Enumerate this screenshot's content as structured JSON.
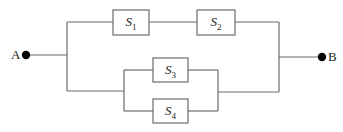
{
  "diagram": {
    "type": "reliability-block-diagram",
    "terminals": [
      {
        "id": "A",
        "label": "A"
      },
      {
        "id": "B",
        "label": "B"
      }
    ],
    "components": [
      {
        "id": "S1",
        "symbol": "S",
        "subscript": "1"
      },
      {
        "id": "S2",
        "symbol": "S",
        "subscript": "2"
      },
      {
        "id": "S3",
        "symbol": "S",
        "subscript": "3"
      },
      {
        "id": "S4",
        "symbol": "S",
        "subscript": "4"
      }
    ],
    "structure": "A — [ (S1 series S2) parallel (S3 parallel S4) ] — B",
    "colors": {
      "wire": "#6b6b6b",
      "node": "#000000"
    }
  }
}
